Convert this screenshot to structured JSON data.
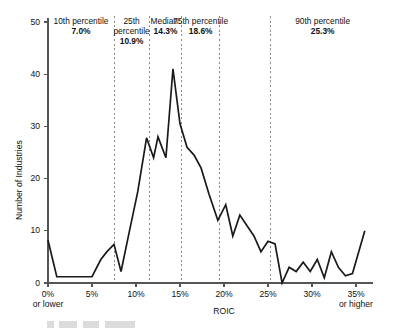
{
  "chart_data": {
    "type": "line",
    "title": "",
    "xlabel": "ROIC",
    "ylabel": "Number of Industries",
    "xlim": [
      0,
      36
    ],
    "ylim": [
      0,
      50
    ],
    "grid": false,
    "legend": "none",
    "x_tick_labels": [
      "0%",
      "5%",
      "10%",
      "15%",
      "20%",
      "25%",
      "30%",
      "35%"
    ],
    "x_tick_values": [
      0,
      5,
      10,
      15,
      20,
      25,
      30,
      35
    ],
    "x_first_tick_sub": "or lower",
    "x_last_tick_sub": "or higher",
    "y_tick_labels": [
      "0",
      "10",
      "20",
      "30",
      "40",
      "50"
    ],
    "y_tick_values": [
      0,
      10,
      20,
      30,
      40,
      50
    ],
    "x": [
      0,
      1,
      2,
      3,
      4,
      5,
      6,
      6.7,
      7.5,
      8.3,
      9.2,
      10.2,
      11.2,
      12.0,
      12.5,
      13.4,
      14.2,
      15.0,
      15.8,
      16.6,
      17.4,
      18.3,
      19.3,
      20.2,
      21.0,
      21.8,
      22.6,
      23.4,
      24.2,
      25.0,
      25.8,
      26.6,
      27.4,
      28.2,
      29.0,
      29.8,
      30.6,
      31.4,
      32.2,
      33.0,
      33.8,
      34.6,
      36.0
    ],
    "values": [
      8.2,
      1.2,
      1.2,
      1.2,
      1.2,
      1.2,
      4.5,
      6.0,
      7.4,
      2.2,
      9.5,
      17.5,
      27.8,
      24.0,
      28.0,
      24.0,
      41.0,
      30.5,
      26.0,
      24.5,
      22.0,
      17.0,
      12.0,
      15.0,
      9.0,
      13.0,
      11.0,
      9.0,
      6.0,
      8.0,
      7.5,
      0.0,
      3.0,
      2.2,
      4.0,
      2.2,
      4.5,
      1.0,
      6.0,
      3.0,
      1.4,
      1.8,
      10.0
    ],
    "annotations": [
      {
        "id": "p10",
        "title": "10th percentile",
        "value": "7.0%",
        "x_value": 7.0,
        "band_start": 0,
        "band_end": 7.5
      },
      {
        "id": "p25",
        "title": "25th percentile",
        "value": "10.9%",
        "x_value": 10.9,
        "band_start": 7.5,
        "band_end": 11.5
      },
      {
        "id": "median",
        "title": "Median:",
        "value": "14.3%",
        "x_value": 14.3,
        "band_start": 11.5,
        "band_end": 15.2
      },
      {
        "id": "p75",
        "title": "75th percentile",
        "value": "18.6%",
        "x_value": 18.6,
        "band_start": 15.2,
        "band_end": 19.5
      },
      {
        "id": "p90",
        "title": "90th percentile",
        "value": "25.3%",
        "x_value": 25.3,
        "band_start": 19.5,
        "band_end": 36.0
      }
    ],
    "divider_x_values": [
      7.5,
      11.5,
      15.2,
      19.5,
      25.3
    ],
    "series_color": "#1a1a1a",
    "divider_color": "#8a8a8a",
    "axis_color": "#555555"
  }
}
